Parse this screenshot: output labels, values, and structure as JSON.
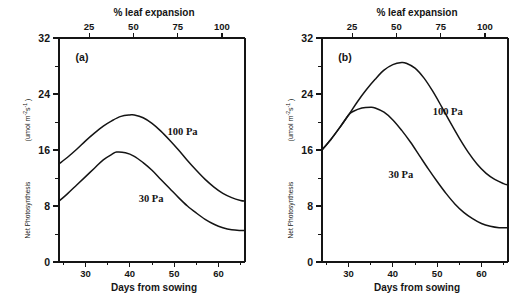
{
  "figure": {
    "panels": [
      {
        "id": "a",
        "label": "(a)",
        "x_axis": {
          "title": "Days from sowing",
          "ticks": [
            30,
            40,
            50,
            60
          ],
          "range": [
            24,
            66
          ]
        },
        "top_axis": {
          "title": "% leaf expansion",
          "ticks": [
            25,
            50,
            75,
            100
          ],
          "range": [
            8,
            113
          ]
        },
        "y_axis": {
          "title": "Net Photosynthesis",
          "unit": "(umol m-2 s-1 )",
          "unit_parts": {
            "prefix": "(umol  m",
            "sup1": "-2",
            "mid": "s",
            "sup2": "-1",
            "suffix": " )"
          },
          "ticks": [
            0,
            8,
            16,
            24,
            32
          ],
          "minor_ticks": [
            4,
            12,
            20,
            28
          ],
          "range": [
            0,
            32
          ]
        },
        "series": [
          {
            "name": "100 Pa",
            "label": "100 Pa",
            "label_x": 48.5,
            "label_y": 18.2,
            "x": [
              24,
              26,
              28,
              30,
              32,
              34,
              36,
              38,
              40,
              41,
              43,
              45,
              47,
              49,
              51,
              53,
              55,
              57,
              59,
              61,
              63,
              65,
              66
            ],
            "y": [
              14.0,
              15.0,
              16.1,
              17.3,
              18.4,
              19.4,
              20.2,
              20.8,
              21.0,
              21.0,
              20.6,
              19.8,
              18.7,
              17.4,
              16.0,
              14.5,
              13.1,
              11.8,
              10.7,
              9.8,
              9.2,
              8.8,
              8.7
            ]
          },
          {
            "name": "30 Pa",
            "label": "30 Pa",
            "label_x": 42.0,
            "label_y": 8.6,
            "x": [
              24,
              26,
              28,
              30,
              32,
              34,
              36,
              37,
              39,
              41,
              43,
              45,
              47,
              49,
              51,
              53,
              55,
              57,
              59,
              61,
              63,
              65,
              66
            ],
            "y": [
              8.7,
              9.8,
              11.0,
              12.2,
              13.4,
              14.6,
              15.4,
              15.7,
              15.6,
              15.1,
              14.2,
              13.1,
              11.8,
              10.5,
              9.2,
              8.0,
              7.0,
              6.1,
              5.4,
              4.9,
              4.6,
              4.5,
              4.5
            ]
          }
        ]
      },
      {
        "id": "b",
        "label": "(b)",
        "x_axis": {
          "title": "Days from sowing",
          "ticks": [
            30,
            40,
            50,
            60
          ],
          "range": [
            24,
            66
          ]
        },
        "top_axis": {
          "title": "% leaf expansion",
          "ticks": [
            25,
            50,
            75,
            100
          ],
          "range": [
            8,
            113
          ]
        },
        "y_axis": {
          "title": "Net Photosynthesis",
          "unit": "(umol m-2 s-1 )",
          "unit_parts": {
            "prefix": "(umol  m",
            "sup1": "-2",
            "mid": "s",
            "sup2": "-1",
            "suffix": " )"
          },
          "ticks": [
            0,
            8,
            16,
            24,
            32
          ],
          "minor_ticks": [
            4,
            12,
            20,
            28
          ],
          "range": [
            0,
            32
          ]
        },
        "series": [
          {
            "name": "100 Pa",
            "label": "100 Pa",
            "label_x": 49.0,
            "label_y": 21.0,
            "x": [
              24,
              26,
              28,
              30,
              32,
              34,
              36,
              38,
              40,
              42,
              43,
              45,
              47,
              49,
              51,
              53,
              55,
              57,
              59,
              61,
              63,
              65,
              66
            ],
            "y": [
              16.0,
              17.5,
              19.2,
              21.0,
              22.9,
              24.6,
              26.1,
              27.4,
              28.2,
              28.5,
              28.4,
              27.7,
              26.3,
              24.4,
              22.2,
              19.9,
              17.7,
              15.7,
              14.0,
              12.7,
              11.8,
              11.2,
              11.0
            ]
          },
          {
            "name": "30 Pa",
            "label": "30 Pa",
            "label_x": 39.0,
            "label_y": 12.0,
            "x": [
              24,
              26,
              28,
              30,
              31,
              33,
              35,
              36,
              38,
              40,
              42,
              44,
              46,
              48,
              50,
              52,
              54,
              56,
              58,
              60,
              62,
              64,
              66
            ],
            "y": [
              16.0,
              17.5,
              19.2,
              21.0,
              21.5,
              22.0,
              22.1,
              22.0,
              21.4,
              20.3,
              18.8,
              17.1,
              15.2,
              13.3,
              11.5,
              9.8,
              8.3,
              7.1,
              6.2,
              5.5,
              5.1,
              4.9,
              4.9
            ]
          }
        ]
      }
    ]
  }
}
